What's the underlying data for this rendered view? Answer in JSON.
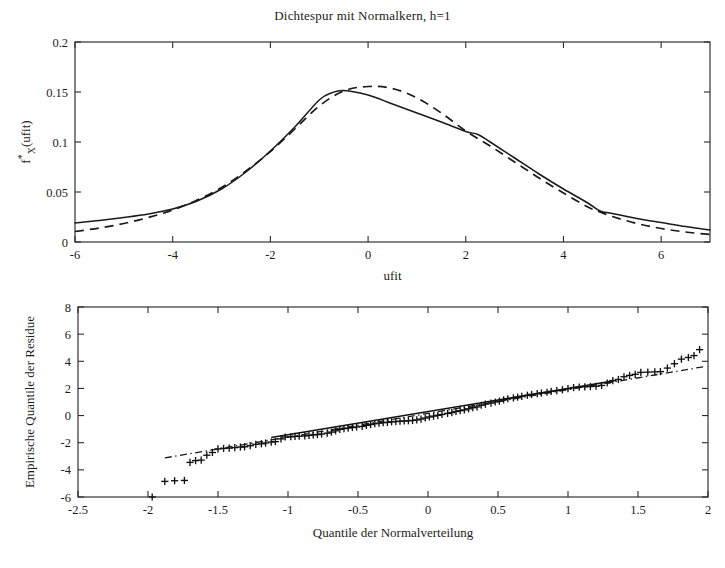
{
  "figure": {
    "background": "#ffffff",
    "ink_color": "#1a1a1a"
  },
  "chart_data": [
    {
      "id": "density-trace",
      "type": "line",
      "title": "Dichtespur mit Normalkern, h=1",
      "xlabel": "ufit",
      "ylabel": "f*X(ufit)",
      "ylabel_parts": {
        "base": "f",
        "superscript": "*",
        "subscript": "X",
        "tail": "(ufit)"
      },
      "xlim": [
        -6,
        7
      ],
      "ylim": [
        0,
        0.2
      ],
      "xticks": [
        -6,
        -4,
        -2,
        0,
        2,
        4,
        6
      ],
      "xticklabels": [
        "-6",
        "-4",
        "-2",
        "0",
        "2",
        "4",
        "6"
      ],
      "yticks": [
        0,
        0.05,
        0.1,
        0.15,
        0.2
      ],
      "yticklabels": [
        "0",
        "0.05",
        "0.1",
        "0.15",
        "0.2"
      ],
      "grid": false,
      "legend": "none",
      "series": [
        {
          "name": "Dichtespur (empirisch)",
          "style": "solid",
          "x": [
            -6.0,
            -5.5,
            -5.0,
            -4.5,
            -4.0,
            -3.5,
            -3.0,
            -2.5,
            -2.0,
            -1.5,
            -1.0,
            -0.75,
            -0.5,
            0.0,
            0.5,
            1.0,
            1.5,
            2.0,
            2.25,
            2.5,
            3.0,
            3.5,
            4.0,
            4.5,
            4.75,
            5.0,
            5.5,
            6.0,
            6.5,
            7.0
          ],
          "y": [
            0.019,
            0.0215,
            0.0245,
            0.028,
            0.033,
            0.041,
            0.053,
            0.07,
            0.091,
            0.115,
            0.142,
            0.149,
            0.1515,
            0.147,
            0.138,
            0.129,
            0.12,
            0.1105,
            0.1075,
            0.1,
            0.084,
            0.068,
            0.053,
            0.039,
            0.031,
            0.0285,
            0.0235,
            0.0195,
            0.0155,
            0.012
          ]
        },
        {
          "name": "Normalkern-Schaetzung",
          "style": "dashed",
          "x": [
            -6.0,
            -5.5,
            -5.0,
            -4.5,
            -4.0,
            -3.5,
            -3.0,
            -2.5,
            -2.0,
            -1.5,
            -1.0,
            -0.5,
            0.0,
            0.5,
            1.0,
            1.5,
            2.0,
            2.5,
            3.0,
            3.5,
            4.0,
            4.5,
            4.75,
            5.0,
            5.5,
            6.0,
            6.5,
            7.0
          ],
          "y": [
            0.0105,
            0.014,
            0.0185,
            0.0245,
            0.032,
            0.042,
            0.0545,
            0.071,
            0.0905,
            0.113,
            0.136,
            0.151,
            0.1555,
            0.1535,
            0.144,
            0.129,
            0.111,
            0.096,
            0.08,
            0.064,
            0.049,
            0.035,
            0.03,
            0.0255,
            0.0185,
            0.0135,
            0.01,
            0.0075
          ]
        }
      ]
    },
    {
      "id": "qq-plot",
      "type": "scatter",
      "title": "",
      "xlabel": "Quantile der Normalverteilung",
      "ylabel": "Empirische Quantile der Residue",
      "xlim": [
        -2.5,
        2
      ],
      "ylim": [
        -6,
        8
      ],
      "xticks": [
        -2.5,
        -2,
        -1.5,
        -1,
        -0.5,
        0,
        0.5,
        1,
        1.5,
        2
      ],
      "xticklabels": [
        "-2.5",
        "-2",
        "-1.5",
        "-1",
        "-0.5",
        "0",
        "0.5",
        "1",
        "1.5",
        "2"
      ],
      "yticks": [
        -6,
        -4,
        -2,
        0,
        2,
        4,
        6,
        8
      ],
      "yticklabels": [
        "-6",
        "-4",
        "-2",
        "0",
        "2",
        "4",
        "6",
        "8"
      ],
      "grid": false,
      "legend": "none",
      "marker": "plus",
      "points": [
        [
          -1.97,
          -6.0
        ],
        [
          -1.88,
          -4.85
        ],
        [
          -1.81,
          -4.8
        ],
        [
          -1.74,
          -4.78
        ],
        [
          -1.7,
          -3.45
        ],
        [
          -1.66,
          -3.32
        ],
        [
          -1.62,
          -3.28
        ],
        [
          -1.58,
          -2.92
        ],
        [
          -1.54,
          -2.72
        ],
        [
          -1.5,
          -2.46
        ],
        [
          -1.46,
          -2.42
        ],
        [
          -1.42,
          -2.4
        ],
        [
          -1.38,
          -2.36
        ],
        [
          -1.34,
          -2.32
        ],
        [
          -1.31,
          -2.3
        ],
        [
          -1.27,
          -2.22
        ],
        [
          -1.23,
          -2.12
        ],
        [
          -1.19,
          -2.08
        ],
        [
          -1.16,
          -2.02
        ],
        [
          -1.12,
          -1.95
        ],
        [
          -1.09,
          -1.92
        ],
        [
          -1.05,
          -1.72
        ],
        [
          -1.02,
          -1.58
        ],
        [
          -0.98,
          -1.56
        ],
        [
          -0.95,
          -1.54
        ],
        [
          -0.92,
          -1.52
        ],
        [
          -0.88,
          -1.5
        ],
        [
          -0.85,
          -1.46
        ],
        [
          -0.82,
          -1.42
        ],
        [
          -0.79,
          -1.4
        ],
        [
          -0.76,
          -1.36
        ],
        [
          -0.72,
          -1.3
        ],
        [
          -0.69,
          -1.22
        ],
        [
          -0.66,
          -1.12
        ],
        [
          -0.63,
          -1.02
        ],
        [
          -0.6,
          -0.96
        ],
        [
          -0.57,
          -0.92
        ],
        [
          -0.54,
          -0.88
        ],
        [
          -0.51,
          -0.84
        ],
        [
          -0.47,
          -0.8
        ],
        [
          -0.44,
          -0.72
        ],
        [
          -0.41,
          -0.66
        ],
        [
          -0.38,
          -0.6
        ],
        [
          -0.35,
          -0.56
        ],
        [
          -0.32,
          -0.52
        ],
        [
          -0.29,
          -0.5
        ],
        [
          -0.26,
          -0.46
        ],
        [
          -0.23,
          -0.44
        ],
        [
          -0.2,
          -0.42
        ],
        [
          -0.17,
          -0.4
        ],
        [
          -0.14,
          -0.38
        ],
        [
          -0.11,
          -0.36
        ],
        [
          -0.08,
          -0.32
        ],
        [
          -0.05,
          -0.26
        ],
        [
          -0.02,
          -0.18
        ],
        [
          0.01,
          -0.1
        ],
        [
          0.04,
          -0.04
        ],
        [
          0.07,
          0.02
        ],
        [
          0.1,
          0.08
        ],
        [
          0.14,
          0.16
        ],
        [
          0.17,
          0.22
        ],
        [
          0.2,
          0.3
        ],
        [
          0.23,
          0.36
        ],
        [
          0.26,
          0.42
        ],
        [
          0.29,
          0.5
        ],
        [
          0.32,
          0.58
        ],
        [
          0.35,
          0.64
        ],
        [
          0.38,
          0.76
        ],
        [
          0.41,
          0.84
        ],
        [
          0.45,
          0.92
        ],
        [
          0.48,
          1.0
        ],
        [
          0.51,
          1.06
        ],
        [
          0.54,
          1.16
        ],
        [
          0.57,
          1.24
        ],
        [
          0.61,
          1.3
        ],
        [
          0.64,
          1.36
        ],
        [
          0.67,
          1.42
        ],
        [
          0.71,
          1.5
        ],
        [
          0.74,
          1.56
        ],
        [
          0.78,
          1.62
        ],
        [
          0.81,
          1.66
        ],
        [
          0.85,
          1.72
        ],
        [
          0.88,
          1.78
        ],
        [
          0.92,
          1.84
        ],
        [
          0.96,
          1.9
        ],
        [
          1.0,
          1.98
        ],
        [
          1.04,
          2.06
        ],
        [
          1.08,
          2.1
        ],
        [
          1.12,
          2.12
        ],
        [
          1.16,
          2.14
        ],
        [
          1.2,
          2.16
        ],
        [
          1.24,
          2.22
        ],
        [
          1.28,
          2.4
        ],
        [
          1.32,
          2.58
        ],
        [
          1.36,
          2.66
        ],
        [
          1.4,
          2.86
        ],
        [
          1.44,
          2.96
        ],
        [
          1.48,
          3.04
        ],
        [
          1.52,
          3.18
        ],
        [
          1.57,
          3.2
        ],
        [
          1.62,
          3.22
        ],
        [
          1.66,
          3.24
        ],
        [
          1.71,
          3.5
        ],
        [
          1.76,
          3.82
        ],
        [
          1.81,
          4.16
        ],
        [
          1.86,
          4.28
        ],
        [
          1.9,
          4.42
        ],
        [
          1.94,
          4.86
        ]
      ],
      "fit_line": {
        "name": "Regressionsgerade durch Quartile",
        "style": "solid",
        "x": [
          -1.12,
          1.33
        ],
        "y": [
          -1.62,
          2.56
        ]
      },
      "reference_line": {
        "name": "Referenzlinie",
        "style": "dash-dot",
        "x": [
          -1.88,
          1.98
        ],
        "y": [
          -3.12,
          3.62
        ]
      }
    }
  ]
}
